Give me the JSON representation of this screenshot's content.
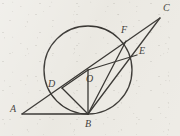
{
  "figure": {
    "kind": "euclidean-geometry-diagram",
    "stroke_color": "#1d1b18",
    "background_color": "#eceae4",
    "viewbox": {
      "width": 180,
      "height": 136
    },
    "circle": {
      "label": "O",
      "cx": 88,
      "cy": 70,
      "r": 44
    },
    "points": {
      "A": {
        "x": 22,
        "y": 114,
        "label": "A"
      },
      "B": {
        "x": 88,
        "y": 114,
        "label": "B"
      },
      "C": {
        "x": 160,
        "y": 18,
        "label": "C"
      },
      "D": {
        "x": 62,
        "y": 88,
        "label": "D"
      },
      "E": {
        "x": 137,
        "y": 55,
        "label": "E"
      },
      "F": {
        "x": 126,
        "y": 41,
        "label": "F"
      },
      "O": {
        "x": 88,
        "y": 70,
        "label": "O"
      }
    },
    "labels": [
      {
        "text": "A",
        "x": 10,
        "y": 108
      },
      {
        "text": "B",
        "x": 85,
        "y": 122
      },
      {
        "text": "C",
        "x": 164,
        "y": 5
      },
      {
        "text": "D",
        "x": 48,
        "y": 80
      },
      {
        "text": "E",
        "x": 140,
        "y": 45
      },
      {
        "text": "F",
        "x": 122,
        "y": 26
      },
      {
        "text": "O",
        "x": 87,
        "y": 77
      }
    ],
    "segments": [
      {
        "name": "A-C",
        "from": "A",
        "to": "C",
        "through": [
          "D",
          "F"
        ]
      },
      {
        "name": "A-B",
        "from": "A",
        "to": "B",
        "through": []
      },
      {
        "name": "B-C",
        "from": "B",
        "to": "C",
        "through": [
          "E"
        ]
      },
      {
        "name": "B-D",
        "from": "B",
        "to": "D",
        "through": []
      },
      {
        "name": "B-F",
        "from": "B",
        "to": "F",
        "through": []
      },
      {
        "name": "B-O",
        "from": "B",
        "to": "O",
        "through": []
      },
      {
        "name": "D-O",
        "from": "D",
        "to": "O",
        "through": []
      },
      {
        "name": "O-E",
        "from": "O",
        "to": "E",
        "through": []
      }
    ]
  }
}
